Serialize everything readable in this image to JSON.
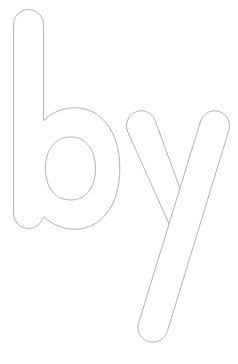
{
  "page": {
    "type": "coloring-worksheet",
    "title": "by",
    "background_color": "#ffffff",
    "outline_color": "#b2b2b2",
    "fill_color": "#ffffff",
    "stroke_width": 1,
    "width": 238,
    "height": 364
  },
  "word": {
    "text": "by",
    "style": "outline",
    "case": "lowercase",
    "letters": [
      {
        "character": "b",
        "name": "letter-b",
        "description": "lowercase b outline with ascender stem and bowl",
        "has_counter": true,
        "bounds": {
          "x": 13,
          "y": 9,
          "width": 107,
          "height": 220
        }
      },
      {
        "character": "y",
        "name": "letter-y",
        "description": "lowercase y outline with two arms and a descender tail",
        "has_counter": false,
        "bounds": {
          "x": 126,
          "y": 110,
          "width": 104,
          "height": 238
        }
      }
    ]
  }
}
